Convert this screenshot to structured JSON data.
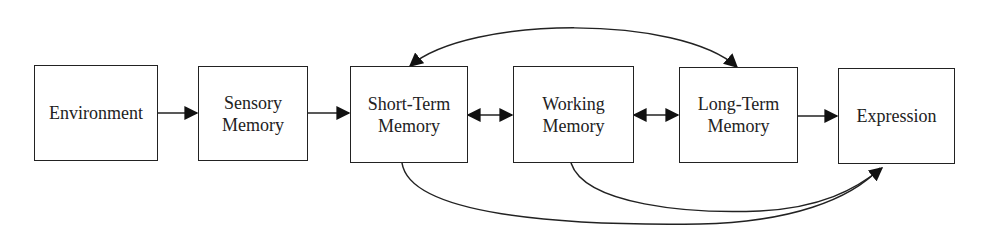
{
  "diagram": {
    "type": "flow",
    "nodes": [
      {
        "id": "environment",
        "lines": [
          "Environment"
        ]
      },
      {
        "id": "sensory",
        "lines": [
          "Sensory",
          "Memory"
        ]
      },
      {
        "id": "short_term",
        "lines": [
          "Short-Term",
          "Memory"
        ]
      },
      {
        "id": "working",
        "lines": [
          "Working",
          "Memory"
        ]
      },
      {
        "id": "long_term",
        "lines": [
          "Long-Term",
          "Memory"
        ]
      },
      {
        "id": "expression",
        "lines": [
          "Expression"
        ]
      }
    ],
    "edges": [
      {
        "from": "environment",
        "to": "sensory",
        "direction": "forward"
      },
      {
        "from": "sensory",
        "to": "short_term",
        "direction": "forward"
      },
      {
        "from": "short_term",
        "to": "working",
        "direction": "both"
      },
      {
        "from": "working",
        "to": "long_term",
        "direction": "both"
      },
      {
        "from": "long_term",
        "to": "expression",
        "direction": "forward"
      },
      {
        "from": "short_term",
        "to": "long_term",
        "direction": "both",
        "style": "arc-top"
      },
      {
        "from": "short_term",
        "to": "expression",
        "direction": "forward",
        "style": "arc-bottom"
      },
      {
        "from": "working",
        "to": "expression",
        "direction": "forward",
        "style": "arc-bottom"
      }
    ],
    "colors": {
      "stroke": "#222222",
      "fill": "#ffffff"
    }
  }
}
